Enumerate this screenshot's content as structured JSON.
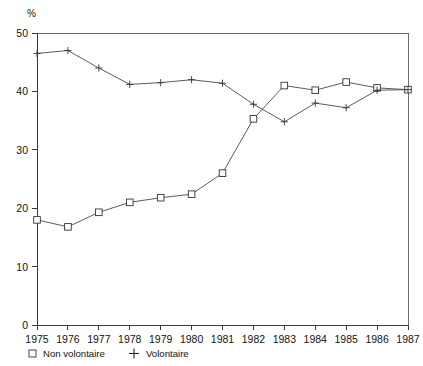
{
  "chart_data": {
    "type": "line",
    "title": "",
    "xlabel": "",
    "ylabel": "%",
    "ylim": [
      0,
      50
    ],
    "yticks": [
      0,
      10,
      20,
      30,
      40,
      50
    ],
    "grid": false,
    "legend_position": "bottom-left",
    "x": [
      1975,
      1976,
      1977,
      1978,
      1979,
      1980,
      1981,
      1982,
      1983,
      1984,
      1985,
      1986,
      1987
    ],
    "categories": [
      "1975",
      "1976",
      "1977",
      "1978",
      "1979",
      "1980",
      "1981",
      "1982",
      "1983",
      "1984",
      "1985",
      "1986",
      "1987"
    ],
    "series": [
      {
        "name": "Non volontaire",
        "marker": "open-square",
        "values": [
          18.0,
          16.8,
          19.3,
          21.0,
          21.8,
          22.4,
          26.0,
          35.3,
          41.0,
          40.2,
          41.6,
          40.6,
          40.3
        ]
      },
      {
        "name": "Volontaire",
        "marker": "plus",
        "values": [
          46.5,
          47.0,
          44.0,
          41.2,
          41.5,
          42.0,
          41.4,
          37.8,
          34.8,
          38.0,
          37.2,
          40.2,
          40.3
        ]
      }
    ]
  },
  "axes": {
    "unit_label": "%",
    "y_tick_labels": [
      "0",
      "10",
      "20",
      "30",
      "40",
      "50"
    ],
    "x_tick_labels": [
      "1975",
      "1976",
      "1977",
      "1978",
      "1979",
      "1980",
      "1981",
      "1982",
      "1983",
      "1984",
      "1985",
      "1986",
      "1987"
    ]
  },
  "legend": {
    "entries": [
      {
        "label": "Non volontaire",
        "marker": "open-square"
      },
      {
        "label": "Volontaire",
        "marker": "plus"
      }
    ]
  },
  "colors": {
    "line": "#4a4a4a",
    "marker_stroke": "#333333",
    "axis": "#3a3a3a",
    "frame": "#6e6e6e",
    "text": "#131313",
    "background": "#ffffff"
  }
}
